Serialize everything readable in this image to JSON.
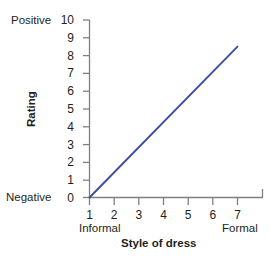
{
  "chart_data": {
    "type": "line",
    "title": "",
    "xlabel": "Style of dress",
    "ylabel": "Rating",
    "xlim": [
      1,
      7.65
    ],
    "ylim": [
      0,
      10
    ],
    "grid": false,
    "legend": "none",
    "line_color": "#3b4f9e",
    "axis_color": "#808080",
    "text_color": "#231f20",
    "x_ticks": [
      "1",
      "2",
      "3",
      "4",
      "5",
      "6",
      "7"
    ],
    "y_ticks": [
      "0",
      "1",
      "2",
      "3",
      "4",
      "5",
      "6",
      "7",
      "8",
      "9",
      "10"
    ],
    "x_axis_low_anchor": "Informal",
    "x_axis_high_anchor": "Formal",
    "y_axis_low_anchor": "Negative",
    "y_axis_high_anchor": "Positive",
    "series": [
      {
        "name": "rating vs style of dress",
        "x": [
          1,
          7
        ],
        "values": [
          0,
          8.5
        ]
      }
    ],
    "annotations": []
  }
}
